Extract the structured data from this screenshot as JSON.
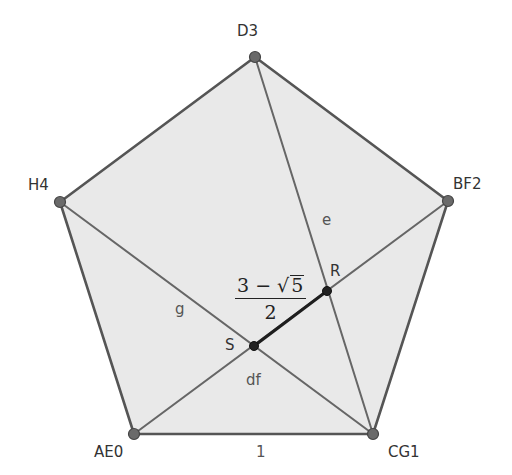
{
  "colors": {
    "fill": "#e8e8e8",
    "edge": "#555555",
    "segment_RS": "#222222",
    "vertex_fill": "#666666",
    "vertex_stroke": "#444444",
    "intersection_fill": "#222222"
  },
  "vertices": {
    "D3": {
      "label": "D3",
      "x": 255,
      "y": 57
    },
    "H4": {
      "label": "H4",
      "x": 60,
      "y": 202
    },
    "BF2": {
      "label": "BF2",
      "x": 448,
      "y": 201
    },
    "AE0": {
      "label": "AE0",
      "x": 134,
      "y": 434
    },
    "CG1": {
      "label": "CG1",
      "x": 373,
      "y": 434
    }
  },
  "intersections": {
    "R": {
      "label": "R",
      "x": 327,
      "y": 291
    },
    "S": {
      "label": "S",
      "x": 254,
      "y": 346
    }
  },
  "segment_labels": {
    "base": "1",
    "e": "e",
    "g": "g",
    "df": "df"
  },
  "formula": {
    "numerator_left": "3 − ",
    "sqrt_symbol": "√",
    "radicand": "5",
    "denominator": "2"
  }
}
